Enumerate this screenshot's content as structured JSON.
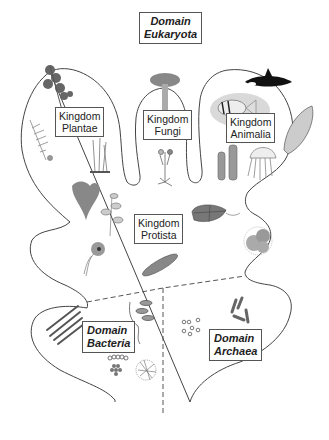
{
  "diagram": {
    "type": "classification-regions",
    "colors": {
      "outline": "#444444",
      "divider_dashed": "#555555",
      "label_border": "#555555",
      "organism_gray": "#888888",
      "fish_highlight": "#d9d9d9"
    },
    "domains": {
      "eukaryota": {
        "line1": "Domain",
        "line2": "Eukaryota"
      },
      "bacteria": {
        "line1": "Domain",
        "line2": "Bacteria"
      },
      "archaea": {
        "line1": "Domain",
        "line2": "Archaea"
      }
    },
    "kingdoms": {
      "plantae": {
        "line1": "Kingdom",
        "line2": "Plantae"
      },
      "fungi": {
        "line1": "Kingdom",
        "line2": "Fungi"
      },
      "animalia": {
        "line1": "Kingdom",
        "line2": "Animalia"
      },
      "protista": {
        "line1": "Kingdom",
        "line2": "Protista"
      }
    },
    "organisms": [
      "plant-branch-icon",
      "fern-icon",
      "moss-icon",
      "mushroom-icon",
      "mold-icon",
      "orca-icon",
      "fish-icon",
      "clam-icon",
      "sponge-icon",
      "jellyfish-icon",
      "seaweed-icon",
      "algae-branch-icon",
      "flagellate-icon",
      "dinoflagellate-icon",
      "diatom-icon",
      "radiolarian-icon",
      "rod-bacteria-icon",
      "spiral-bacteria-icon",
      "cocci-chain-icon",
      "cocci-cluster-icon",
      "filamentous-bacteria-icon",
      "archaea-rods-icon",
      "archaea-cocci-icon"
    ]
  }
}
